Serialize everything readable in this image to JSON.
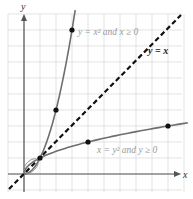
{
  "chart_data": {
    "type": "line",
    "title": "",
    "xlabel": "x",
    "ylabel": "y",
    "xlim": [
      -1,
      10
    ],
    "ylim": [
      -1,
      10
    ],
    "grid": true,
    "series": [
      {
        "name": "y = x^2 and x >= 0",
        "label": "y = x² and x ≥ 0",
        "style": "solid",
        "points": [
          [
            0,
            0
          ],
          [
            1,
            1
          ],
          [
            2,
            4
          ],
          [
            3,
            9
          ]
        ],
        "marked_points": [
          [
            1,
            1
          ],
          [
            2,
            4
          ],
          [
            3,
            9
          ]
        ]
      },
      {
        "name": "x = y^2 and y >= 0",
        "label": "x = y² and y ≥ 0",
        "style": "solid",
        "points": [
          [
            0,
            0
          ],
          [
            1,
            1
          ],
          [
            4,
            2
          ],
          [
            9,
            3
          ]
        ],
        "marked_points": [
          [
            1,
            1
          ],
          [
            4,
            2
          ],
          [
            9,
            3
          ]
        ]
      },
      {
        "name": "y = x",
        "label": "y = x",
        "style": "dashed",
        "points": [
          [
            -0.8,
            -0.8
          ],
          [
            9.5,
            9.5
          ]
        ]
      }
    ],
    "annotations": [
      "y = x² and x ≥ 0",
      "y = x",
      "x = y² and y ≥ 0"
    ]
  },
  "labels": {
    "x_axis": "x",
    "y_axis": "y",
    "parabola_up": "y = x² and x ≥ 0",
    "diagonal": "y = x",
    "parabola_side": "x = y² and y ≥ 0"
  },
  "colors": {
    "grid": "#dcdcdc",
    "curve": "#6e6e6e",
    "diagonal": "#111111",
    "label_light": "#999999"
  }
}
